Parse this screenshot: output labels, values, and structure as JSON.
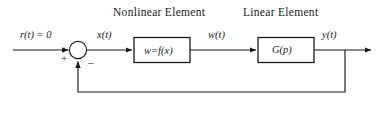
{
  "figure": {
    "type": "block-diagram",
    "title_nonlinear": "Nonlinear  Element",
    "title_linear": "Linear Element"
  },
  "signals": {
    "input": "r(t) = 0",
    "error": "x(t)",
    "nonlinear_output": "w(t)",
    "output": "y(t)"
  },
  "blocks": {
    "nonlinear": "w=f(x)",
    "linear": "G(p)"
  },
  "summing_junction": {
    "plus": "+",
    "minus": "–"
  },
  "colors": {
    "stroke": "#1a1a1a",
    "text": "#1a1a1a",
    "background": "#ffffff"
  }
}
